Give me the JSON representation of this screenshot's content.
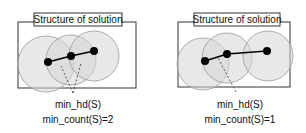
{
  "panels": [
    {
      "title": "Structure of solution",
      "label_hd": "min_hd(S)",
      "label_count": "min_count(S)=2",
      "nodes": [
        [
          48,
          62
        ],
        [
          71,
          56
        ],
        [
          94,
          51
        ]
      ],
      "circles": [
        [
          46,
          64,
          28
        ],
        [
          71,
          60,
          25
        ],
        [
          94,
          56,
          25
        ]
      ],
      "edges": [
        [
          0,
          1
        ],
        [
          1,
          2
        ]
      ],
      "dashed_from": [
        73,
        93
      ],
      "dashed_to": [
        [
          61,
          72
        ],
        [
          81,
          70
        ]
      ]
    },
    {
      "title": "Structure of solution",
      "label_hd": "min_hd(S)",
      "label_count": "min_count(S)=1",
      "nodes": [
        [
          205,
          61
        ],
        [
          227,
          54
        ],
        [
          267,
          51
        ]
      ],
      "circles": [
        [
          203,
          64,
          26
        ],
        [
          227,
          58,
          25
        ],
        [
          268,
          56,
          25
        ]
      ],
      "edges": [
        [
          0,
          1
        ],
        [
          1,
          2
        ]
      ],
      "dashed_from": [
        236,
        92
      ],
      "dashed_to": [
        [
          219,
          60
        ]
      ]
    }
  ],
  "colors": {
    "circle_fill": "#d9d9d9",
    "circle_stroke": "#9a9a9a",
    "box_stroke": "#333333",
    "node": "#000000"
  }
}
